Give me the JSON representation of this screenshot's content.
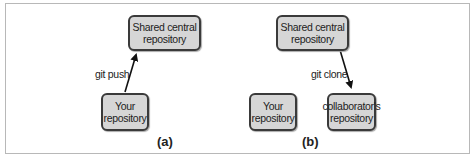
{
  "panel_a": {
    "central": "Shared central repository",
    "local": "Your repository",
    "arrow_label": "git push",
    "caption": "(a)"
  },
  "panel_b": {
    "central": "Shared central repository",
    "local": "Your repository",
    "collaborator": "collaborator's repository",
    "arrow_label": "git clone",
    "caption": "(b)"
  }
}
